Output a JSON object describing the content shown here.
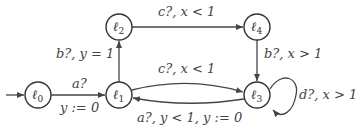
{
  "diagram": {
    "type": "timed-automaton",
    "states": [
      {
        "id": "l0",
        "label": "ℓ",
        "sub": "0",
        "initial": true
      },
      {
        "id": "l1",
        "label": "ℓ",
        "sub": "1"
      },
      {
        "id": "l2",
        "label": "ℓ",
        "sub": "2"
      },
      {
        "id": "l3",
        "label": "ℓ",
        "sub": "3"
      },
      {
        "id": "l4",
        "label": "ℓ",
        "sub": "4"
      }
    ],
    "edges": [
      {
        "from": "l0",
        "to": "l1",
        "label_top": "a?",
        "label_bottom": "y := 0"
      },
      {
        "from": "l1",
        "to": "l2",
        "label": "b?, y = 1"
      },
      {
        "from": "l2",
        "to": "l4",
        "label": "c?, x < 1"
      },
      {
        "from": "l4",
        "to": "l3",
        "label": "b?, x > 1"
      },
      {
        "from": "l1",
        "to": "l3",
        "label": "c?, x < 1"
      },
      {
        "from": "l3",
        "to": "l1",
        "label": "a?, y < 1, y := 0"
      },
      {
        "from": "l3",
        "to": "l3",
        "label": "d?, x > 1"
      }
    ],
    "colors": {
      "stroke": "#444444",
      "fill": "#ffffff"
    }
  }
}
